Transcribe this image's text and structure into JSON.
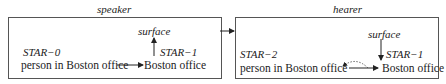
{
  "speaker": {
    "title": "speaker",
    "surface_label": "surface",
    "star_left": "STAR−0",
    "star_right": "STAR−1",
    "left_text": "person in Boston office",
    "right_text": "Boston office"
  },
  "hearer": {
    "title": "hearer",
    "surface_label": "surface",
    "star_left": "STAR−2",
    "star_right": "STAR−1",
    "left_text": "person in Boston office",
    "right_text": "Boston office"
  }
}
